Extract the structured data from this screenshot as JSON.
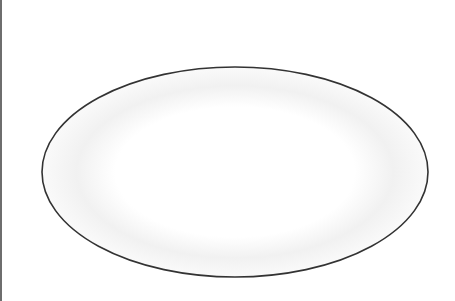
{
  "canvas": {
    "width": 455,
    "height": 301,
    "background": "#ffffff",
    "left_border_color": "#6e6e6e"
  },
  "shapes": [
    {
      "type": "ellipse",
      "cx": 235,
      "cy": 172,
      "rx": 193,
      "ry": 105,
      "stroke": "#333333",
      "stroke_width": 1.6,
      "fill": "#ffffff",
      "inner_shade_color": "#ececec"
    }
  ]
}
